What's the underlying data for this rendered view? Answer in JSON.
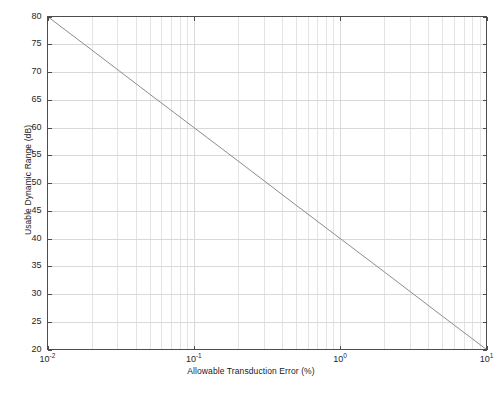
{
  "chart_data": {
    "type": "line",
    "title": "",
    "xlabel": "Allowable Transduction Error (%)",
    "ylabel": "Usable Dynamic Range (dB)",
    "xscale": "log",
    "yscale": "linear",
    "xlim": [
      0.01,
      10
    ],
    "ylim": [
      20,
      80
    ],
    "grid": true,
    "grid_minor": true,
    "legend": null,
    "xticks": [
      {
        "value": 0.01,
        "mantissa": "10",
        "exponent": "-2"
      },
      {
        "value": 0.1,
        "mantissa": "10",
        "exponent": "-1"
      },
      {
        "value": 1,
        "mantissa": "10",
        "exponent": "0"
      },
      {
        "value": 10,
        "mantissa": "10",
        "exponent": "1"
      }
    ],
    "yticks": [
      20,
      25,
      30,
      35,
      40,
      45,
      50,
      55,
      60,
      65,
      70,
      75,
      80
    ],
    "series": [
      {
        "name": "Usable Dynamic Range",
        "color": "#8c8c8c",
        "linewidth": 1,
        "x": [
          0.01,
          0.02,
          0.05,
          0.1,
          0.2,
          0.5,
          1,
          2,
          5,
          10
        ],
        "y": [
          80.0,
          74.0,
          66.0,
          60.0,
          54.0,
          46.0,
          40.0,
          34.0,
          26.0,
          20.0
        ]
      }
    ],
    "annotations": []
  },
  "axes": {
    "frame_color": "#4d4d4d",
    "grid_color": "#d9d9d9",
    "background": "#ffffff"
  }
}
